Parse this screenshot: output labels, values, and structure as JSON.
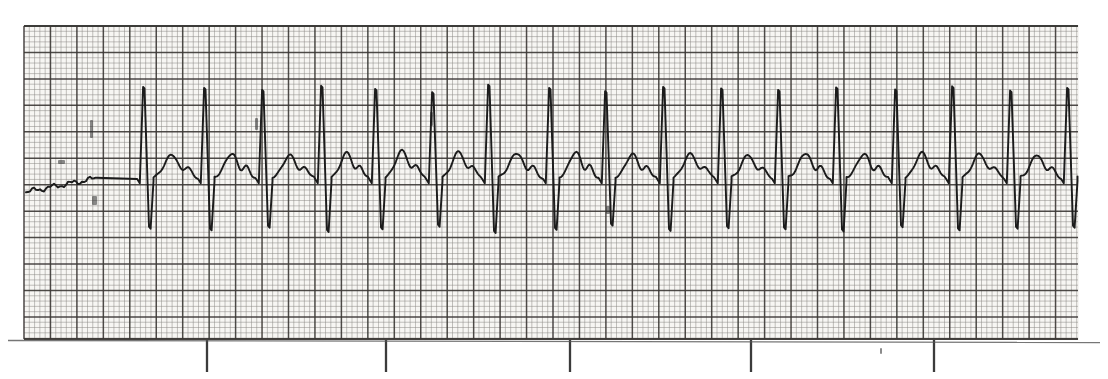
{
  "document": {
    "kind": "ecg-rhythm-strip",
    "title": "ECG Rhythm Strip",
    "media": "scanned-grid-paper"
  },
  "paper": {
    "background_color": "#f6f5f2",
    "page_color": "#ffffff",
    "minor_grid_color": "#8d8a86",
    "major_grid_color": "#3a3734",
    "trace_color": "#1a1a1a",
    "grid_left": 24,
    "grid_top": 26,
    "grid_right": 1078,
    "grid_bottom": 339,
    "minor_step_px": 5.29,
    "major_every": 5,
    "speed_mm_per_s": 25,
    "gain_mm_per_mV": 10,
    "small_box_seconds": 0.04,
    "large_box_seconds": 0.2
  },
  "timing_marks": {
    "label": "3-second timing marks",
    "interval_seconds": 3,
    "tick_length_px": 33,
    "positions_px": [
      207,
      386,
      570,
      751,
      934
    ]
  },
  "chart_data": {
    "type": "line",
    "xlabel": "Time (s)",
    "ylabel": "Amplitude (mV)",
    "xlim": [
      0,
      7.96
    ],
    "ylim": [
      -1.6,
      2.1
    ],
    "grid": true,
    "legend": null,
    "paper_speed_mm_per_s": 25,
    "gain_mm_per_mV": 10,
    "baseline_y_px": 178,
    "px_per_mV": 53,
    "px_per_second": 132.25,
    "interpretation": {
      "rhythm": "regular narrow-complex tachycardia",
      "rate_bpm": 128,
      "qrs": "narrow, tall R wave with deep S wave",
      "t_wave": "broad, upright, prominent",
      "notes": "Sequential beats of uniform morphology; slight beat-to-beat interval variation"
    },
    "beats": [
      {
        "index": 1,
        "r_peak_x_px": 144,
        "rr_px": null,
        "r_amp_mV": 1.72,
        "s_amp_mV": -0.92,
        "t_amp_mV": 0.44
      },
      {
        "index": 2,
        "r_peak_x_px": 205,
        "rr_px": 61,
        "r_amp_mV": 1.7,
        "s_amp_mV": -0.95,
        "t_amp_mV": 0.46
      },
      {
        "index": 3,
        "r_peak_x_px": 263,
        "rr_px": 58,
        "r_amp_mV": 1.66,
        "s_amp_mV": -0.9,
        "t_amp_mV": 0.43
      },
      {
        "index": 4,
        "r_peak_x_px": 322,
        "rr_px": 59,
        "r_amp_mV": 1.74,
        "s_amp_mV": -0.98,
        "t_amp_mV": 0.48
      },
      {
        "index": 5,
        "r_peak_x_px": 376,
        "rr_px": 54,
        "r_amp_mV": 1.68,
        "s_amp_mV": -0.93,
        "t_amp_mV": 0.52
      },
      {
        "index": 6,
        "r_peak_x_px": 433,
        "rr_px": 57,
        "r_amp_mV": 1.62,
        "s_amp_mV": -0.88,
        "t_amp_mV": 0.5
      },
      {
        "index": 7,
        "r_peak_x_px": 489,
        "rr_px": 56,
        "r_amp_mV": 1.76,
        "s_amp_mV": -1.0,
        "t_amp_mV": 0.47
      },
      {
        "index": 8,
        "r_peak_x_px": 550,
        "rr_px": 61,
        "r_amp_mV": 1.7,
        "s_amp_mV": -0.94,
        "t_amp_mV": 0.49
      },
      {
        "index": 9,
        "r_peak_x_px": 606,
        "rr_px": 56,
        "r_amp_mV": 1.64,
        "s_amp_mV": -0.86,
        "t_amp_mV": 0.45
      },
      {
        "index": 10,
        "r_peak_x_px": 664,
        "rr_px": 58,
        "r_amp_mV": 1.72,
        "s_amp_mV": -0.96,
        "t_amp_mV": 0.46
      },
      {
        "index": 11,
        "r_peak_x_px": 722,
        "rr_px": 58,
        "r_amp_mV": 1.69,
        "s_amp_mV": -0.91,
        "t_amp_mV": 0.44
      },
      {
        "index": 12,
        "r_peak_x_px": 779,
        "rr_px": 57,
        "r_amp_mV": 1.66,
        "s_amp_mV": -0.93,
        "t_amp_mV": 0.47
      },
      {
        "index": 13,
        "r_peak_x_px": 837,
        "rr_px": 58,
        "r_amp_mV": 1.71,
        "s_amp_mV": -0.97,
        "t_amp_mV": 0.45
      },
      {
        "index": 14,
        "r_peak_x_px": 896,
        "rr_px": 59,
        "r_amp_mV": 1.67,
        "s_amp_mV": -0.89,
        "t_amp_mV": 0.48
      },
      {
        "index": 15,
        "r_peak_x_px": 953,
        "rr_px": 57,
        "r_amp_mV": 1.73,
        "s_amp_mV": -0.95,
        "t_amp_mV": 0.46
      },
      {
        "index": 16,
        "r_peak_x_px": 1011,
        "rr_px": 58,
        "r_amp_mV": 1.65,
        "s_amp_mV": -0.92,
        "t_amp_mV": 0.44
      },
      {
        "index": 17,
        "r_peak_x_px": 1068,
        "rr_px": 57,
        "r_amp_mV": 1.7,
        "s_amp_mV": -0.9,
        "t_amp_mV": 0.45
      }
    ],
    "lead_in_segment": {
      "description": "flat drifting baseline with scan artifacts before first beat",
      "x_range_px": [
        24,
        120
      ]
    }
  },
  "artifacts": {
    "description": "scanner speckle and faint ink smudges on paper",
    "spots": [
      {
        "x": 58,
        "y": 160,
        "w": 7,
        "h": 4
      },
      {
        "x": 92,
        "y": 196,
        "w": 5,
        "h": 9
      },
      {
        "x": 90,
        "y": 120,
        "w": 3,
        "h": 18
      },
      {
        "x": 255,
        "y": 118,
        "w": 3,
        "h": 12
      },
      {
        "x": 430,
        "y": 112,
        "w": 3,
        "h": 14
      },
      {
        "x": 606,
        "y": 206,
        "w": 4,
        "h": 8
      },
      {
        "x": 880,
        "y": 348,
        "w": 2,
        "h": 6
      }
    ]
  }
}
